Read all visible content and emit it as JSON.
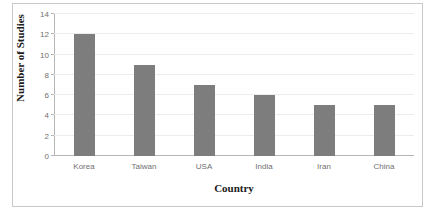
{
  "chart_data": {
    "type": "bar",
    "title": "",
    "categories": [
      "Korea",
      "Taiwan",
      "USA",
      "India",
      "Iran",
      "China"
    ],
    "values": [
      12,
      9,
      7,
      6,
      5,
      5
    ],
    "xlabel": "Country",
    "ylabel": "Number of Studies",
    "ylim": [
      0,
      14
    ],
    "ytick_labels": [
      "0",
      "2",
      "4",
      "6",
      "8",
      "10",
      "12",
      "14"
    ],
    "ytick_values": [
      0,
      2,
      4,
      6,
      8,
      10,
      12,
      14
    ],
    "grid": "horizontal",
    "legend": "none",
    "bar_color": "#7d7d7d",
    "gridline_color": "#ececec",
    "axis_color": "#b5b5b5",
    "frame_color": "#c8c8c8",
    "background": "#ffffff"
  }
}
